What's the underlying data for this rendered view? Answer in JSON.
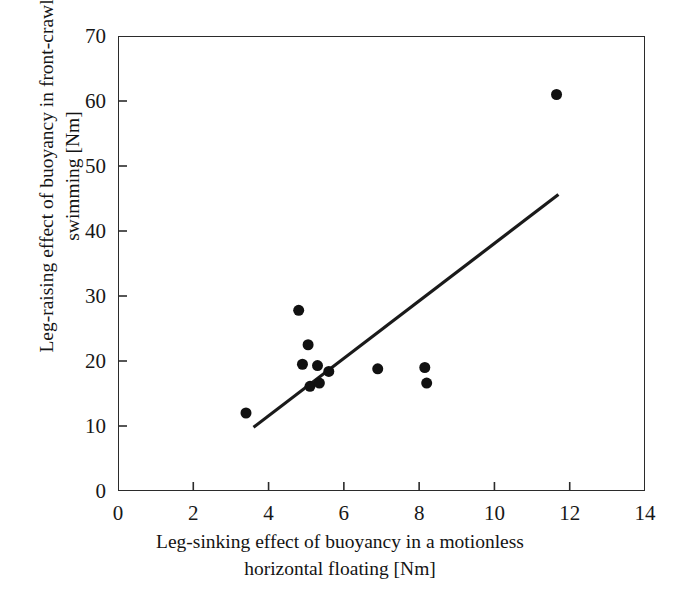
{
  "chart_data": {
    "type": "scatter",
    "title": "",
    "xlabel": "Leg-sinking effect of buoyancy in a motionless horizontal floating [Nm]",
    "xlabel_line1": "Leg-sinking effect of buoyancy in a motionless",
    "xlabel_line2": "horizontal floating [Nm]",
    "ylabel": "Leg-raising effect of buoyancy in front-crawl swimming [Nm]",
    "ylabel_line1": "Leg-raising effect of buoyancy in front-crawl",
    "ylabel_line2": "swimming [Nm]",
    "xlim": [
      0,
      14
    ],
    "ylim": [
      0,
      70
    ],
    "xticks": [
      0,
      2,
      4,
      6,
      8,
      10,
      12,
      14
    ],
    "yticks": [
      0,
      10,
      20,
      30,
      40,
      50,
      60,
      70
    ],
    "xtick_labels": [
      "0",
      "2",
      "4",
      "6",
      "8",
      "10",
      "12",
      "14"
    ],
    "ytick_labels": [
      "0",
      "10",
      "20",
      "30",
      "40",
      "50",
      "60",
      "70"
    ],
    "grid": false,
    "legend": false,
    "marker": "filled-circle",
    "marker_color": "#111111",
    "marker_size": 11,
    "points": [
      {
        "x": 3.4,
        "y": 12.0
      },
      {
        "x": 4.8,
        "y": 27.8
      },
      {
        "x": 5.05,
        "y": 22.5
      },
      {
        "x": 4.9,
        "y": 19.5
      },
      {
        "x": 5.3,
        "y": 19.3
      },
      {
        "x": 5.6,
        "y": 18.4
      },
      {
        "x": 5.1,
        "y": 16.1
      },
      {
        "x": 5.35,
        "y": 16.6
      },
      {
        "x": 6.9,
        "y": 18.8
      },
      {
        "x": 8.15,
        "y": 19.0
      },
      {
        "x": 8.2,
        "y": 16.6
      },
      {
        "x": 11.65,
        "y": 61.0
      }
    ],
    "trendline": {
      "type": "linear-fit",
      "x_start": 3.6,
      "y_start": 9.8,
      "x_end": 11.7,
      "y_end": 45.6,
      "color": "#1a1a1a",
      "width": 3.2
    },
    "axis_color": "#2b2b2b",
    "background": "#ffffff"
  },
  "page_bleed": {
    "lines": [
      {
        "text": "",
        "x": 10,
        "y": 44
      },
      {
        "text": "",
        "x": 30,
        "y": 72
      },
      {
        "text": "",
        "x": 20,
        "y": 100
      },
      {
        "text": "",
        "x": 25,
        "y": 560
      },
      {
        "text": "",
        "x": 15,
        "y": 588
      }
    ]
  }
}
